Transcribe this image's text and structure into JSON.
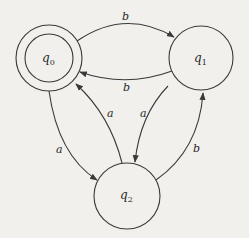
{
  "diagram": {
    "type": "finite-automaton",
    "states": [
      {
        "id": "q0",
        "label": "q",
        "sub": "0",
        "accepting": true,
        "cx": 49,
        "cy": 58,
        "r": 33
      },
      {
        "id": "q1",
        "label": "q",
        "sub": "1",
        "accepting": false,
        "cx": 201,
        "cy": 58,
        "r": 32
      },
      {
        "id": "q2",
        "label": "q",
        "sub": "2",
        "accepting": false,
        "cx": 127,
        "cy": 196,
        "r": 33
      }
    ],
    "transitions": [
      {
        "from": "q0",
        "to": "q1",
        "symbol": "b"
      },
      {
        "from": "q1",
        "to": "q0",
        "symbol": "b"
      },
      {
        "from": "q2",
        "to": "q0",
        "symbol": "a"
      },
      {
        "from": "q1",
        "to": "q2",
        "symbol": "a"
      },
      {
        "from": "q0",
        "to": "q2",
        "symbol": "a"
      },
      {
        "from": "q2",
        "to": "q1",
        "symbol": "b"
      }
    ],
    "colors": {
      "stroke": "#3a3a3a",
      "background": "#f1f0ec"
    }
  }
}
